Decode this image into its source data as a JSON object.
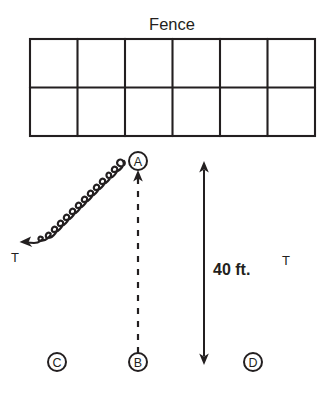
{
  "diagram": {
    "title": "Fence",
    "fence": {
      "rows": 2,
      "columns": 6,
      "label": "Fence"
    },
    "markers": [
      {
        "id": "A",
        "label": "A",
        "cx": 138,
        "cy": 161
      },
      {
        "id": "B",
        "label": "B",
        "cx": 138,
        "cy": 362
      },
      {
        "id": "C",
        "label": "C",
        "cx": 57,
        "cy": 362
      },
      {
        "id": "D",
        "label": "D",
        "cx": 253,
        "cy": 362
      }
    ],
    "dimension": {
      "label": "40 ft.",
      "value": "40",
      "unit": "ft."
    },
    "annotations": {
      "tension_left": "T",
      "tension_right": "T"
    }
  }
}
